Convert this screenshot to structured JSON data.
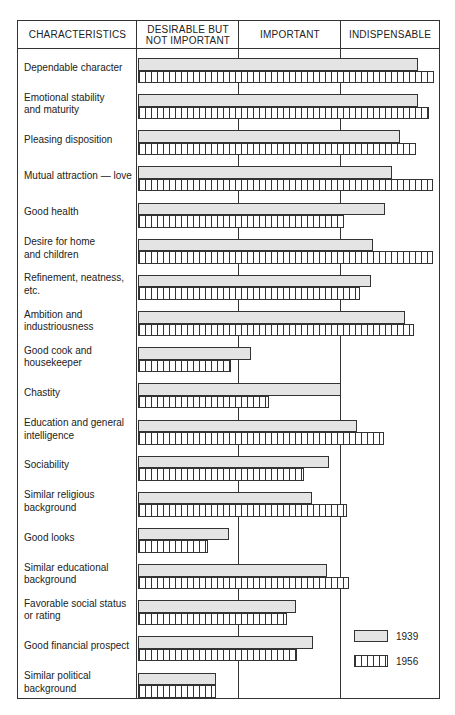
{
  "chart_data": {
    "type": "bar",
    "orientation": "horizontal",
    "title": "",
    "columns": [
      "CHARACTERISTICS",
      "DESIRABLE BUT\nNOT IMPORTANT",
      "IMPORTANT",
      "INDISPENSABLE"
    ],
    "scale_note": "Bar length on a 0–3 scale: 0–1 Desirable but not important, 1–2 Important, 2–3 Indispensable",
    "xlim": [
      0,
      3
    ],
    "grid": false,
    "legend_position": "lower right",
    "categories": [
      "Dependable character",
      "Emotional stability\nand maturity",
      "Pleasing disposition",
      "Mutual attraction — love",
      "Good health",
      "Desire for home\nand children",
      "Refinement, neatness, etc.",
      "Ambition and\nindustriousness",
      "Good cook and\nhousekeeper",
      "Chastity",
      "Education and general\nintelligence",
      "Sociability",
      "Similar religious\nbackground",
      "Good looks",
      "Similar educational\nbackground",
      "Favorable social status\nor rating",
      "Good financial prospect",
      "Similar political\nbackground"
    ],
    "series": [
      {
        "name": "1939",
        "pattern": "dotted",
        "values": [
          2.76,
          2.76,
          2.58,
          2.5,
          2.43,
          2.32,
          2.3,
          2.63,
          1.11,
          2.0,
          2.16,
          1.88,
          1.71,
          0.9,
          1.86,
          1.56,
          1.72,
          0.77
        ]
      },
      {
        "name": "1956",
        "pattern": "vertical-stripes",
        "values": [
          2.92,
          2.87,
          2.74,
          2.91,
          2.03,
          2.91,
          2.19,
          2.72,
          0.92,
          1.29,
          2.42,
          1.64,
          2.06,
          0.69,
          2.08,
          1.47,
          1.57,
          0.77
        ]
      }
    ],
    "legend": [
      "1939",
      "1956"
    ]
  },
  "headers": {
    "characteristics": "CHARACTERISTICS",
    "desirable": "DESIRABLE BUT\nNOT IMPORTANT",
    "important": "IMPORTANT",
    "indispensable": "INDISPENSABLE"
  },
  "legend": {
    "y1939": "1939",
    "y1956": "1956"
  }
}
